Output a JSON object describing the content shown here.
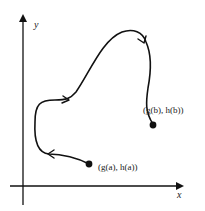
{
  "diagram": {
    "axes": {
      "x_label": "x",
      "y_label": "y"
    },
    "points": {
      "start": {
        "label": "(g(a), h(a))",
        "g": "g",
        "h": "h",
        "param": "a"
      },
      "end": {
        "label": "(g(b), h(b))",
        "g": "g",
        "h": "h",
        "param": "b"
      }
    },
    "colors": {
      "stroke": "#111111",
      "background": "#ffffff"
    }
  }
}
